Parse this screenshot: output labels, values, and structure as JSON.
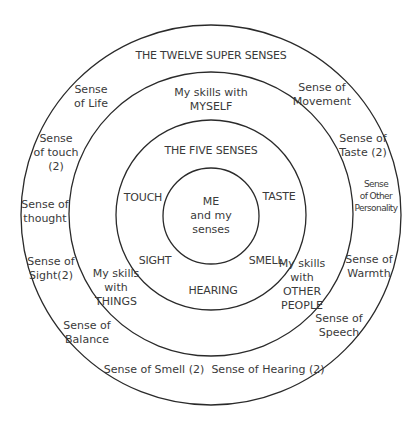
{
  "colors": {
    "background": "#ffffff",
    "stroke": "#2a2a2a",
    "text": "#3a3a3a"
  },
  "rings": [
    {
      "name": "twelve-super-senses-ring",
      "cx": 211,
      "cy": 215,
      "r": 190
    },
    {
      "name": "skills-ring",
      "cx": 211,
      "cy": 214,
      "r": 142
    },
    {
      "name": "five-senses-ring",
      "cx": 211,
      "cy": 215,
      "r": 95
    },
    {
      "name": "me-ring",
      "cx": 211,
      "cy": 216,
      "r": 48
    }
  ],
  "outer_ring": {
    "title": "THE TWELVE SUPER SENSES",
    "senses": [
      "Sense\nof Life",
      "Sense of\nMovement",
      "Sense of\nTaste (2)",
      "Sense\nof Other\nPersonality",
      "Sense of\nWarmth",
      "Sense of\nSpeech",
      "Sense of Hearing (2)",
      "Sense of Smell (2)",
      "Sense of\nBalance",
      "Sense of\nSight(2)",
      "Sense of\nthought",
      "Sense\nof touch\n(2)"
    ]
  },
  "skills_ring": {
    "myself": "My skills with\nMYSELF",
    "other_people": "My skills\nwith\nOTHER\nPEOPLE",
    "things": "My skills\nwith\nTHINGS"
  },
  "five_senses_ring": {
    "title": "THE FIVE SENSES",
    "senses": [
      "TOUCH",
      "TASTE",
      "SMELL",
      "HEARING",
      "SIGHT"
    ]
  },
  "center": {
    "label": "ME\nand my\nsenses"
  }
}
